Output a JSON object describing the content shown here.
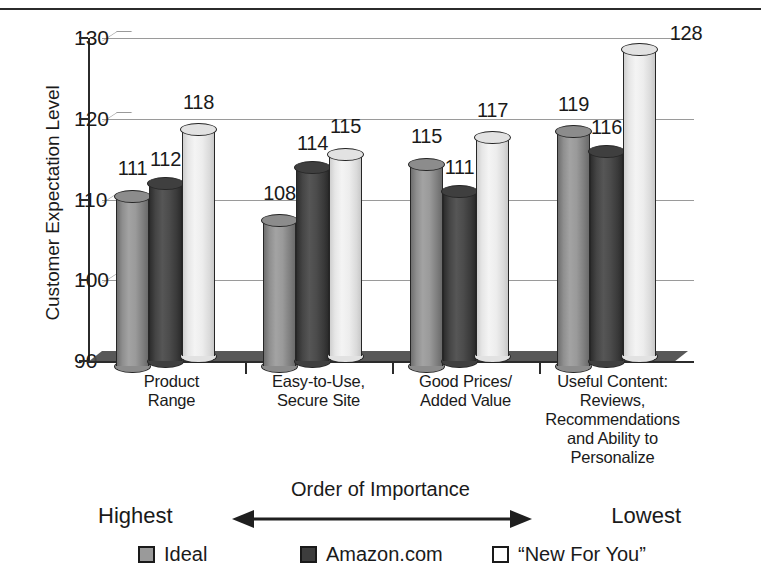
{
  "chart_data": {
    "type": "bar",
    "title": "",
    "xlabel": "Order of Importance",
    "ylabel": "Customer Expectation Level",
    "ylim": [
      90,
      130
    ],
    "yticks": [
      90,
      100,
      110,
      120,
      130
    ],
    "grid": true,
    "legend_position": "bottom",
    "categories": [
      "Product\nRange",
      "Easy-to-Use,\nSecure Site",
      "Good Prices/\nAdded Value",
      "Useful Content:\nReviews,\nRecommendations\nand Ability to\nPersonalize"
    ],
    "series": [
      {
        "name": "Ideal",
        "color": "#8c8c8c",
        "values": [
          111,
          108,
          115,
          119
        ]
      },
      {
        "name": "Amazon.com",
        "color": "#3f3f3f",
        "values": [
          112,
          114,
          111,
          116
        ]
      },
      {
        "name": "“New For You”",
        "color": "#ededed",
        "values": [
          118,
          115,
          117,
          128
        ]
      }
    ],
    "annotations": {
      "axis_direction_label": "Order of Importance",
      "direction_left": "Highest",
      "direction_right": "Lowest"
    }
  },
  "axis": {
    "y_title": "Customer Expectation Level",
    "y_tick_labels": [
      "130",
      "120",
      "110",
      "100",
      "90"
    ]
  },
  "order_bar": {
    "title": "Order of Importance",
    "left_label": "Highest",
    "right_label": "Lowest"
  },
  "legend": {
    "items": [
      {
        "label": "Ideal"
      },
      {
        "label": "Amazon.com"
      },
      {
        "label": "“New For You”"
      }
    ]
  }
}
